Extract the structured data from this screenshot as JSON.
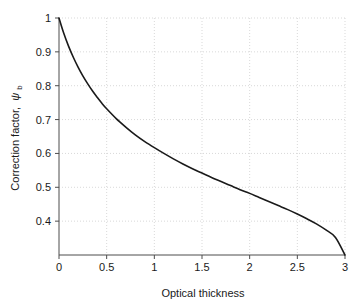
{
  "chart_data": {
    "type": "line",
    "title": "",
    "xlabel": "Optical thickness",
    "ylabel": "Correction factor,",
    "ylabel_symbol": "ψ",
    "ylabel_subscript": "b",
    "xlim": [
      0,
      3
    ],
    "ylim": [
      0.3,
      1.0
    ],
    "grid": true,
    "legend": false,
    "xticks": [
      0,
      0.5,
      1,
      1.5,
      2,
      2.5,
      3
    ],
    "xticklabels": [
      "0",
      "0.5",
      "1",
      "1.5",
      "2",
      "2.5",
      "3"
    ],
    "yticks": [
      0.4,
      0.5,
      0.6,
      0.7,
      0.8,
      0.9,
      1
    ],
    "yticklabels": [
      "0.4",
      "0.5",
      "0.6",
      "0.7",
      "0.8",
      "0.9",
      "1"
    ],
    "series": [
      {
        "name": "correction factor",
        "color": "#1a1a1a",
        "line_width": 1.6,
        "x": [
          0,
          0.05,
          0.1,
          0.15,
          0.2,
          0.25,
          0.3,
          0.35,
          0.4,
          0.45,
          0.5,
          0.6,
          0.7,
          0.8,
          0.9,
          1.0,
          1.1,
          1.2,
          1.3,
          1.4,
          1.5,
          1.6,
          1.7,
          1.8,
          1.9,
          2.0,
          2.1,
          2.2,
          2.3,
          2.4,
          2.5,
          2.6,
          2.7,
          2.8,
          2.9,
          3.0
        ],
        "y": [
          1.0,
          0.955,
          0.917,
          0.884,
          0.855,
          0.829,
          0.806,
          0.785,
          0.766,
          0.748,
          0.732,
          0.703,
          0.678,
          0.655,
          0.635,
          0.617,
          0.6,
          0.584,
          0.569,
          0.555,
          0.542,
          0.529,
          0.517,
          0.505,
          0.493,
          0.482,
          0.47,
          0.458,
          0.446,
          0.434,
          0.421,
          0.407,
          0.392,
          0.374,
          0.352,
          0.3
        ]
      }
    ]
  },
  "axis_style": {
    "axis_color": "#4d4d4d",
    "grid_color": "#d9d9d9",
    "tick_color": "#4d4d4d",
    "background": "#ffffff"
  }
}
